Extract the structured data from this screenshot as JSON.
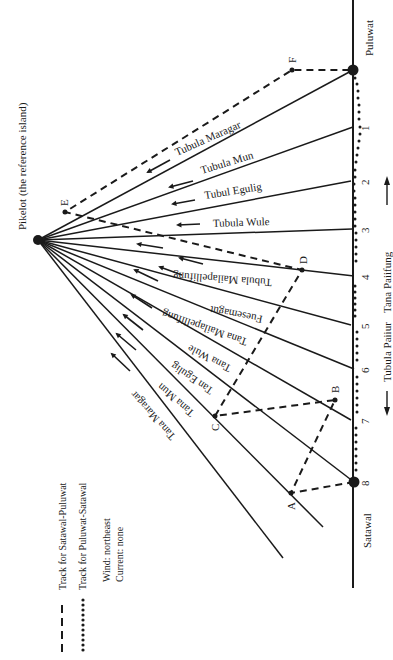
{
  "title": "Pikelot (the reference island)",
  "islands": {
    "reference": "Pikelot (the reference island)",
    "start": "Satawal",
    "destination": "Puluwat"
  },
  "stations": [
    "1",
    "2",
    "3",
    "4",
    "5",
    "6",
    "7",
    "8"
  ],
  "bearings_upper": [
    "Tubula Maragar",
    "Tubula Mun",
    "Tubul Egulig",
    "Tubula Wule"
  ],
  "bearings_lower": [
    "Tubula Mailapellifung",
    "Fuesemagut",
    "Tana Mailapellifung",
    "Tana Wule",
    "Tan Egulig",
    "Tana Mun",
    "Tana Maragar"
  ],
  "track_points": [
    "A",
    "B",
    "C",
    "D",
    "E",
    "F"
  ],
  "side_labels": {
    "upper": "Tana Paiifung",
    "lower": "Tubula Paiiur"
  },
  "legend": {
    "dashed": "Track for Satawal-Puluwat",
    "dotted": "Track for Puluwat-Satawal",
    "wind": "Wind: northeast",
    "current": "Current: none"
  },
  "colors": {
    "ink": "#1a1a1a",
    "paper": "#ffffff"
  }
}
